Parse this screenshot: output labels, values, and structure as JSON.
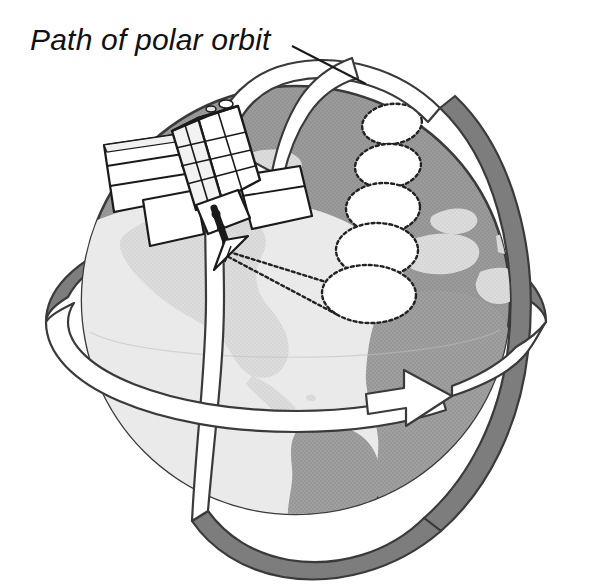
{
  "figure": {
    "title": "Path of polar orbit",
    "background_color": "#ffffff"
  },
  "annotations": {
    "polar_orbit_label": "Path of polar orbit",
    "leader_line": "leader-line-to-polar-orbit-band"
  },
  "globe": {
    "name": "earth-globe",
    "outline_color": "#3a3a3a",
    "ocean_color": "#999999",
    "land_color": "#d9d9d9",
    "lit_base_color": "#e8e8e8",
    "shadow_land_color": "#9a9a9a",
    "center_x": 296,
    "center_y": 300,
    "radius": 215,
    "landmasses": [
      "north-america",
      "south-america",
      "greenland",
      "africa",
      "europe",
      "middle-east"
    ]
  },
  "polar_orbit": {
    "name": "polar-orbit-band",
    "band_color": "#ffffff",
    "behind_color": "#7d7d7d",
    "stroke_color": "#3a3a3a",
    "arrow_direction": "down-left",
    "arrow_label": "polar-orbit-direction-arrow"
  },
  "equatorial_orbit": {
    "name": "equatorial-orbit-band",
    "band_color": "#ffffff",
    "behind_color": "#7d7d7d",
    "stroke_color": "#3a3a3a",
    "arrow_direction": "right",
    "arrow_label": "equatorial-direction-arrow"
  },
  "satellite": {
    "name": "polar-orbiting-satellite",
    "body_color": "#ffffff",
    "panel_color": "#ffffff",
    "outline_color": "#1a1a1a",
    "parts": [
      "satellite-body",
      "solar-panel-left",
      "solar-panel-right",
      "antenna-boom",
      "scan-horn"
    ]
  },
  "scan_swath": {
    "name": "scan-footprint-chain",
    "fill_color": "#ffffff",
    "dash_color": "#222222",
    "footprint_count": 5,
    "footprints": [
      {
        "label": "footprint-1",
        "cx": 392,
        "cy": 124,
        "rx": 30,
        "ry": 20,
        "rot": -8
      },
      {
        "label": "footprint-2",
        "cx": 388,
        "cy": 166,
        "rx": 33,
        "ry": 22,
        "rot": -5
      },
      {
        "label": "footprint-3",
        "cx": 383,
        "cy": 208,
        "rx": 37,
        "ry": 25,
        "rot": -2
      },
      {
        "label": "footprint-4",
        "cx": 377,
        "cy": 250,
        "rx": 41,
        "ry": 27,
        "rot": 0
      },
      {
        "label": "footprint-5",
        "cx": 369,
        "cy": 294,
        "rx": 47,
        "ry": 29,
        "rot": 2
      }
    ],
    "beam_lines": 2
  }
}
